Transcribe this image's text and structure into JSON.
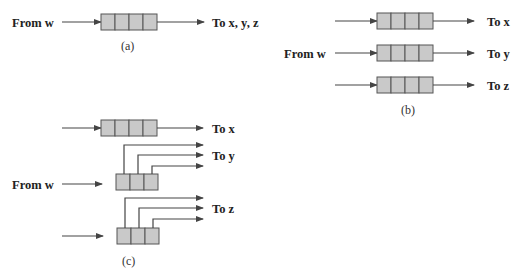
{
  "panel_a": {
    "caption": "(a)",
    "input_label": "From w",
    "output_label": "To x, y, z",
    "queue_cells": 4
  },
  "panel_b": {
    "caption": "(b)",
    "input_label": "From w",
    "outputs": [
      "To x",
      "To y",
      "To z"
    ],
    "queue_cells": 4
  },
  "panel_c": {
    "caption": "(c)",
    "input_label": "From w",
    "outputs": [
      "To x",
      "To y",
      "To z"
    ],
    "queue_cells_top": 4,
    "queue_cells_lower": 3
  },
  "colors": {
    "cell_fill": "#c9c9c9",
    "line": "#444444",
    "text": "#222222"
  }
}
